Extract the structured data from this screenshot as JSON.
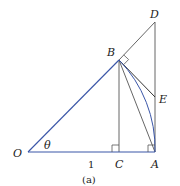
{
  "figure": {
    "caption": "(a)",
    "colors": {
      "blue": "#3a56a8",
      "dark": "#555555",
      "text": "#222222"
    },
    "points": {
      "O": {
        "label": "O",
        "x": 28,
        "y": 152
      },
      "A": {
        "label": "A",
        "x": 155,
        "y": 152
      },
      "B": {
        "label": "B",
        "x": 119,
        "y": 60
      },
      "C": {
        "label": "C",
        "x": 119,
        "y": 152
      },
      "D": {
        "label": "D",
        "x": 155,
        "y": 22
      },
      "E": {
        "label": "E",
        "x": 155,
        "y": 97
      }
    },
    "angle_label": "θ",
    "length_label": "1",
    "segments": [
      {
        "name": "OA",
        "color": "blue"
      },
      {
        "name": "OB",
        "color": "blue"
      },
      {
        "name": "BD",
        "color": "dark"
      },
      {
        "name": "AD",
        "color": "dark"
      },
      {
        "name": "BC",
        "color": "dark"
      },
      {
        "name": "BA",
        "color": "dark"
      },
      {
        "name": "BE",
        "color": "dark"
      },
      {
        "name": "arc-BA",
        "color": "blue"
      }
    ],
    "right_angles": [
      "B",
      "C",
      "A"
    ]
  }
}
